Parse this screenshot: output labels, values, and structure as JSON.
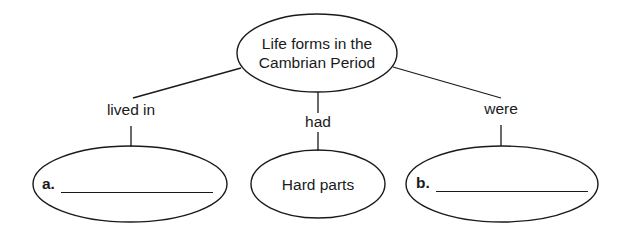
{
  "concept_map": {
    "root": {
      "label_line1": "Life forms in the",
      "label_line2": "Cambrian Period"
    },
    "links": [
      {
        "label": "lived in"
      },
      {
        "label": "had"
      },
      {
        "label": "were"
      }
    ],
    "children": [
      {
        "prefix": "a.",
        "answer": ""
      },
      {
        "label": "Hard parts"
      },
      {
        "prefix": "b.",
        "answer": ""
      }
    ],
    "colors": {
      "stroke": "#1a1a1a",
      "background": "#ffffff"
    }
  }
}
